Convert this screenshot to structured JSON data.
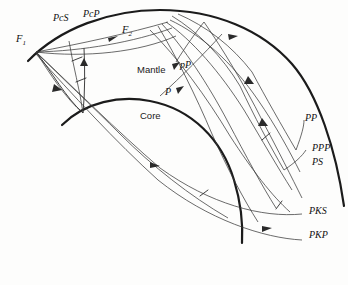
{
  "figure": {
    "type": "seismic-ray-path-diagram",
    "background_color": "#fdfdfc",
    "line_color": "#1b1b1b",
    "ray_color": "#3a3a3a"
  },
  "regions": [
    {
      "name": "mantle",
      "label": "Mantle",
      "x": 137,
      "y": 73
    },
    {
      "name": "core",
      "label": "Core",
      "x": 140,
      "y": 119
    }
  ],
  "foci": [
    {
      "name": "focus-1",
      "label": "F",
      "subscript": "1",
      "x": 16,
      "y": 42
    },
    {
      "name": "focus-2",
      "label": "F",
      "subscript": "2",
      "x": 122,
      "y": 33
    }
  ],
  "phase_labels": [
    {
      "name": "pcs",
      "label": "PcS",
      "x": 53,
      "y": 21
    },
    {
      "name": "pcp",
      "label": "PcP",
      "x": 83,
      "y": 17
    },
    {
      "name": "pp-lower",
      "label": "pP",
      "x": 180,
      "y": 68
    },
    {
      "name": "p",
      "label": "P",
      "x": 165,
      "y": 95
    },
    {
      "name": "pp",
      "label": "PP",
      "x": 305,
      "y": 121
    },
    {
      "name": "ppp",
      "label": "PPP",
      "x": 312,
      "y": 151
    },
    {
      "name": "ps",
      "label": "PS",
      "x": 312,
      "y": 165
    },
    {
      "name": "pks",
      "label": "PKS",
      "x": 309,
      "y": 214
    },
    {
      "name": "pkp",
      "label": "PKP",
      "x": 309,
      "y": 238
    }
  ],
  "boundaries": {
    "surface_label": "earth-surface",
    "core_label": "core-mantle-boundary"
  }
}
